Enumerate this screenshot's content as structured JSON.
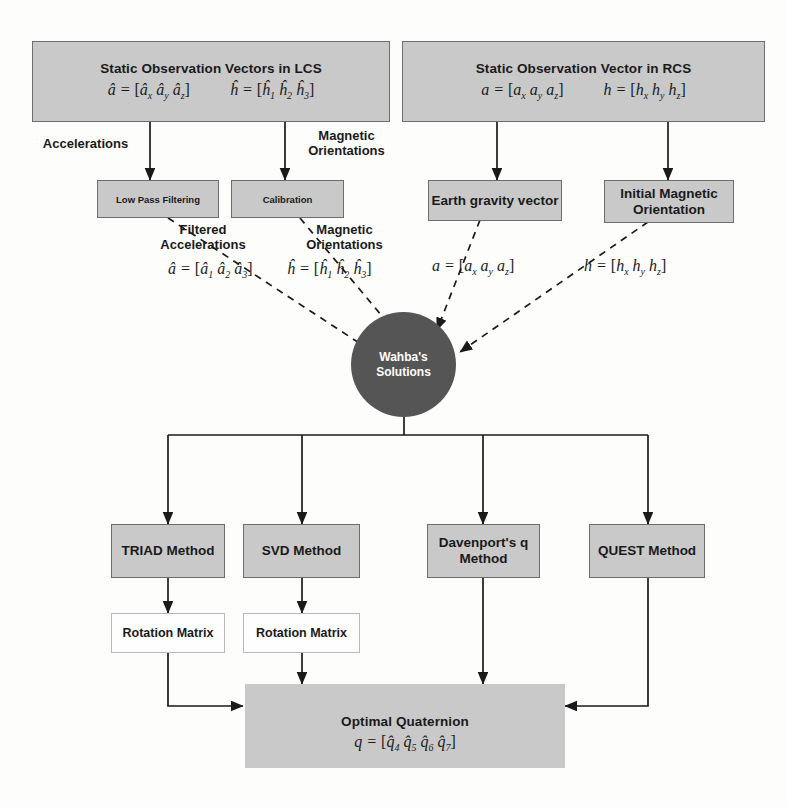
{
  "diagram": {
    "colors": {
      "box_fill": "#c9c9c9",
      "box_border": "#6d6d6d",
      "circle_fill": "#555555",
      "circle_text": "#ffffff",
      "white_box_fill": "#fefefe",
      "line": "#1a1a1a"
    }
  },
  "top": {
    "lcs": {
      "heading": "Static Observation Vectors  in LCS",
      "eq_accel": "â = [âx ây âz]",
      "eq_mag": "ĥ = [ĥ1 ĥ2 ĥ3]"
    },
    "rcs": {
      "heading": "Static Observation Vector  in RCS",
      "eq_accel": "a = [ax ay az]",
      "eq_mag": "h = [hx hy hz]"
    }
  },
  "edge_labels": {
    "accelerations": "Accelerations",
    "magnetic_orientations": "Magnetic Orientations",
    "filtered_accelerations": "Filtered Accelerations",
    "magnetic_orientations_2": "Magnetic Orientations"
  },
  "processing": {
    "low_pass_filtering": "Low Pass Filtering",
    "calibration": "Calibration",
    "earth_gravity_vector": "Earth gravity vector",
    "initial_magnetic_orientation": "Initial Magnetic Orientation"
  },
  "mid_equations": {
    "filtered_accel": "â = [â1 â2 â3]",
    "mag_orient": "ĥ = [ĥ1 ĥ2 ĥ3]",
    "ref_accel": "a = [ax ay az]",
    "ref_mag": "h = [hx hy hz]"
  },
  "hub": {
    "line1": "Wahba's",
    "line2": "Solutions"
  },
  "methods": [
    {
      "label": "TRIAD Method"
    },
    {
      "label": "SVD Method"
    },
    {
      "label": "Davenport's q Method"
    },
    {
      "label": "QUEST Method"
    }
  ],
  "rotation_matrices": [
    {
      "label": "Rotation Matrix"
    },
    {
      "label": "Rotation Matrix"
    }
  ],
  "output": {
    "heading": "Optimal Quaternion",
    "equation": "q = [q̂4 q̂5 q̂6 q̂7]"
  }
}
